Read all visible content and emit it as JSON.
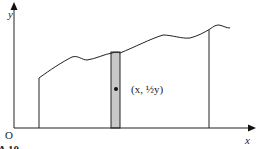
{
  "figure": {
    "y_axis_label": "y",
    "x_axis_label": "x",
    "origin_label": "O",
    "point_label": "(x, ½y)",
    "caption_fragment": "A 10",
    "colors": {
      "stroke": "#222222",
      "strip_fill": "#c8c8c8",
      "background": "#ffffff"
    }
  }
}
